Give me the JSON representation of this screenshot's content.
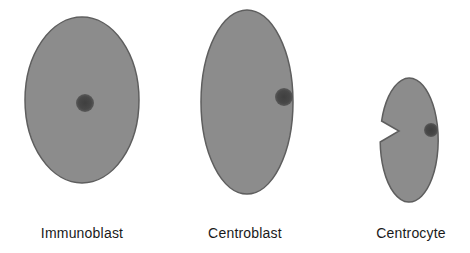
{
  "colors": {
    "cell_fill": "#8c8c8c",
    "cell_stroke": "#5e5e5e",
    "nucleus": "#4a4a4a",
    "background": "#ffffff"
  },
  "cells": [
    {
      "name": "Immunoblast",
      "label": "Immunoblast"
    },
    {
      "name": "Centroblast",
      "label": "Centroblast"
    },
    {
      "name": "Centrocyte",
      "label": "Centrocyte"
    }
  ]
}
